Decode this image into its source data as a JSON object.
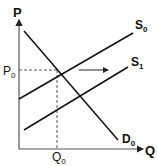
{
  "diagram": {
    "axes": {
      "y_label": "P",
      "x_label": "Q"
    },
    "curves": {
      "supply_initial": {
        "label": "S",
        "subscript": "0"
      },
      "supply_new": {
        "label": "S",
        "subscript": "1"
      },
      "demand": {
        "label": "D",
        "subscript": "0"
      }
    },
    "equilibrium": {
      "price_label": "P",
      "price_subscript": "0",
      "quantity_label": "Q",
      "quantity_subscript": "0"
    },
    "shift_arrow": "rightward",
    "colors": {
      "line": "#111111",
      "axis": "#333333",
      "guide": "#444444"
    }
  }
}
